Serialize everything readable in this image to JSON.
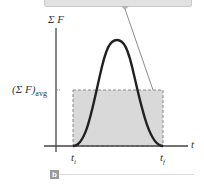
{
  "figure": {
    "panel_label": "b",
    "y_axis_label": "Σ F",
    "x_axis_label": "t",
    "avg_label_main": "(Σ F)",
    "avg_label_sub": "avg",
    "t_initial_main": "t",
    "t_initial_sub": "i",
    "t_final_main": "t",
    "t_final_sub": "f"
  },
  "colors": {
    "curve": "#222222",
    "rect_fill": "#d9d9d9",
    "rect_border": "#8a8a8a",
    "axis": "#444444",
    "leader": "#8c8c8c",
    "callout_fill": "#e2e2e2"
  }
}
